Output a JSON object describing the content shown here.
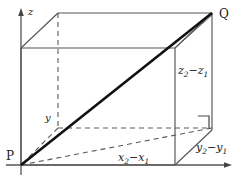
{
  "figure": {
    "type": "3d-distance-box-diagram",
    "colors": {
      "stroke": "#555555",
      "diagonal": "#111111",
      "text": "#1a1a1a",
      "background": "#ffffff"
    },
    "points": {
      "p_label": "P",
      "q_label": "Q"
    },
    "axes": [
      {
        "name": "z-axis",
        "label": "z"
      },
      {
        "name": "y-axis",
        "label": "y"
      }
    ],
    "edge_labels": [
      {
        "name": "depth-edge",
        "label_html": "y<sub>2</sub>&#8722;y<sub>1</sub>",
        "label_text": "y2 - y1"
      },
      {
        "name": "width-edge",
        "label_html": "x<sub>2</sub>&#8722;x<sub>1</sub>",
        "label_text": "x2 - x1"
      },
      {
        "name": "height-edge",
        "label_html": "z<sub>2</sub>&#8722;z<sub>1</sub>",
        "label_text": "z2 - z1"
      }
    ],
    "markers": {
      "right_angle": "right-angle-marker"
    }
  }
}
